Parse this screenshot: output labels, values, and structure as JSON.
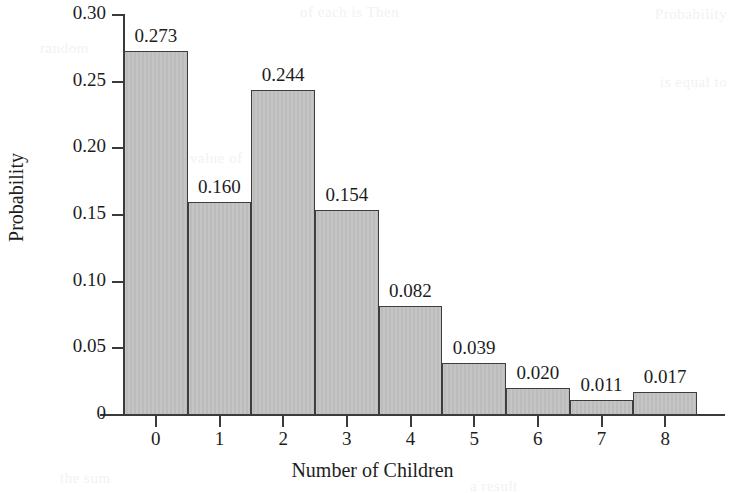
{
  "chart_data": {
    "type": "bar",
    "title": "",
    "xlabel": "Number of Children",
    "ylabel": "Probability",
    "categories": [
      "0",
      "1",
      "2",
      "3",
      "4",
      "5",
      "6",
      "7",
      "8"
    ],
    "values": [
      0.273,
      0.16,
      0.244,
      0.154,
      0.082,
      0.039,
      0.02,
      0.011,
      0.017
    ],
    "data_labels": [
      "0.273",
      "0.160",
      "0.244",
      "0.154",
      "0.082",
      "0.039",
      "0.020",
      "0.011",
      "0.017"
    ],
    "ylim": [
      0,
      0.3
    ],
    "xlim": [
      -0.5,
      8.5
    ],
    "y_ticks": [
      0,
      0.05,
      0.1,
      0.15,
      0.2,
      0.25,
      0.3
    ],
    "y_tick_labels": [
      "0",
      "0.05",
      "0.10",
      "0.15",
      "0.20",
      "0.25",
      "0.30"
    ],
    "grid": false,
    "legend": null,
    "legend_position": "none",
    "bar_fill_color": "#bfbfbf",
    "bar_border_color": "#3d3d3d",
    "axis_color": "#3a3a3a",
    "text_color": "#1d1d1d",
    "background_color": "#ffffff"
  },
  "page": {
    "bleed_ghost_lines": [
      "of each is Then",
      "Probability",
      "random",
      "is equal to",
      "value of",
      "number",
      "variable",
      "the sum",
      "a result"
    ]
  }
}
